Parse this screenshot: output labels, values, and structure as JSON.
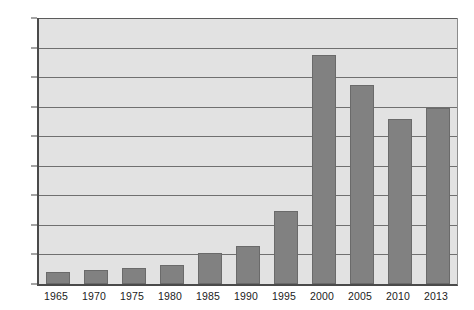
{
  "chart_data": {
    "type": "bar",
    "title": "",
    "subtitle": "",
    "xlabel": "",
    "ylabel": "",
    "categories": [
      "1965",
      "1970",
      "1975",
      "1980",
      "1985",
      "1990",
      "1995",
      "2000",
      "2005",
      "2010",
      "2013"
    ],
    "values": [
      20,
      23,
      27,
      33,
      52,
      64,
      124,
      388,
      337,
      280,
      298
    ],
    "series": [
      {
        "name": "",
        "values": [
          20,
          23,
          27,
          33,
          52,
          64,
          124,
          388,
          337,
          280,
          298
        ]
      }
    ],
    "ylim": [
      0,
      450
    ],
    "ytick_step": 50,
    "yticks": [
      "450",
      "400",
      "350",
      "300",
      "250",
      "200",
      "150",
      "100",
      "50",
      "0"
    ],
    "ytick_values": [
      450,
      400,
      350,
      300,
      250,
      200,
      150,
      100,
      50,
      0
    ],
    "grid": true,
    "grid_axis": "y",
    "legend": false,
    "legend_position": "none",
    "annotations": [],
    "colors": {
      "bar_fill": "#818181",
      "bar_border": "#6a6a6a",
      "plot_background": "#e2e2e2",
      "gridline": "#707070",
      "axis": "#4a4a4a",
      "tick_label": "#1c1c1c",
      "page_background": "#ffffff"
    }
  }
}
